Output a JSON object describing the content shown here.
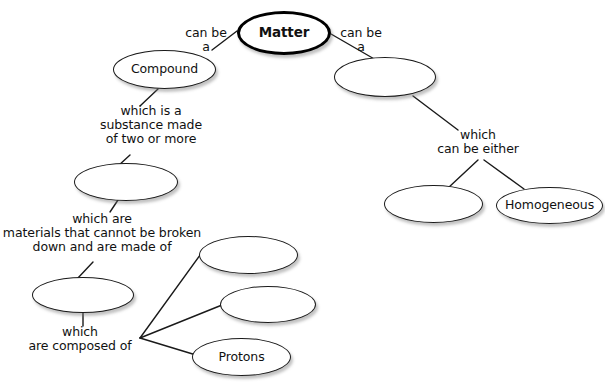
{
  "diagram": {
    "type": "concept-map",
    "style": {
      "background": "#ffffff",
      "node_stroke": "#1a1a1a",
      "root_stroke": "#000000",
      "edge_stroke": "#1a1a1a",
      "text_color": "#111111"
    },
    "nodes": [
      {
        "id": "matter",
        "label": "Matter",
        "filled": true,
        "root": true,
        "x": 237,
        "y": 11,
        "w": 94,
        "h": 44
      },
      {
        "id": "compound",
        "label": "Compound",
        "filled": true,
        "root": false,
        "x": 113,
        "y": 50,
        "w": 103,
        "h": 39
      },
      {
        "id": "blank-left-1",
        "label": "",
        "filled": false,
        "root": false,
        "x": 74,
        "y": 163,
        "w": 104,
        "h": 38
      },
      {
        "id": "blank-left-2",
        "label": "",
        "filled": false,
        "root": false,
        "x": 32,
        "y": 277,
        "w": 102,
        "h": 36
      },
      {
        "id": "blank-sub-1",
        "label": "",
        "filled": false,
        "root": false,
        "x": 199,
        "y": 236,
        "w": 99,
        "h": 38
      },
      {
        "id": "blank-sub-2",
        "label": "",
        "filled": false,
        "root": false,
        "x": 220,
        "y": 286,
        "w": 96,
        "h": 37
      },
      {
        "id": "protons",
        "label": "Protons",
        "filled": true,
        "root": false,
        "x": 192,
        "y": 338,
        "w": 99,
        "h": 38
      },
      {
        "id": "blank-right-1",
        "label": "",
        "filled": false,
        "root": false,
        "x": 334,
        "y": 57,
        "w": 102,
        "h": 40
      },
      {
        "id": "blank-right-2",
        "label": "",
        "filled": false,
        "root": false,
        "x": 384,
        "y": 185,
        "w": 99,
        "h": 38
      },
      {
        "id": "homogeneous",
        "label": "Homogeneous",
        "filled": true,
        "root": false,
        "x": 496,
        "y": 187,
        "w": 107,
        "h": 37
      }
    ],
    "edge_labels": [
      {
        "id": "lbl-can-be-a-left",
        "text": "can be\na",
        "x": 176,
        "y": 26,
        "w": 60
      },
      {
        "id": "lbl-can-be-a-right",
        "text": "can be\na",
        "x": 331,
        "y": 26,
        "w": 60
      },
      {
        "id": "lbl-which-is-a",
        "text": "which is a\nsubstance made\nof two or more",
        "x": 88,
        "y": 104,
        "w": 126
      },
      {
        "id": "lbl-which-are",
        "text": "which are\nmaterials that cannot be broken\ndown and are made of",
        "x": 2,
        "y": 212,
        "w": 200
      },
      {
        "id": "lbl-which-composed",
        "text": "which\nare composed of",
        "x": 22,
        "y": 325,
        "w": 116
      },
      {
        "id": "lbl-which-either",
        "text": "which\ncan be either",
        "x": 428,
        "y": 128,
        "w": 100
      }
    ],
    "edges": [
      {
        "id": "edge-matter-compound",
        "from": "matter",
        "to": "compound",
        "points": [
          [
            237,
            31
          ],
          [
            212,
            50
          ]
        ]
      },
      {
        "id": "edge-matter-right",
        "from": "matter",
        "to": "blank-right-1",
        "points": [
          [
            331,
            34
          ],
          [
            376,
            60
          ]
        ]
      },
      {
        "id": "edge-compound-blank1",
        "from": "compound",
        "to": "blank-left-1",
        "points": [
          [
            158,
            89
          ],
          [
            140,
            106
          ]
        ]
      },
      {
        "id": "edge-blank1-label",
        "from": "blank-left-1",
        "to": "blank-left-2",
        "points": [
          [
            130,
            155
          ],
          [
            118,
            166
          ]
        ]
      },
      {
        "id": "edge-blank1-down",
        "from": "blank-left-1",
        "to": "lbl-which-are",
        "points": [
          [
            118,
            200
          ],
          [
            110,
            212
          ]
        ]
      },
      {
        "id": "edge-label-blank2",
        "from": "lbl-which-are",
        "to": "blank-left-2",
        "points": [
          [
            93,
            262
          ],
          [
            77,
            279
          ]
        ]
      },
      {
        "id": "edge-blank2-down",
        "from": "blank-left-2",
        "to": "lbl-which-comp",
        "points": [
          [
            83,
            312
          ],
          [
            83,
            326
          ]
        ]
      },
      {
        "id": "edge-fan-sub1",
        "from": "lbl-which-comp",
        "to": "blank-sub-1",
        "points": [
          [
            140,
            338
          ],
          [
            203,
            251
          ]
        ]
      },
      {
        "id": "edge-fan-sub2",
        "from": "lbl-which-comp",
        "to": "blank-sub-2",
        "points": [
          [
            140,
            338
          ],
          [
            222,
            305
          ]
        ]
      },
      {
        "id": "edge-fan-protons",
        "from": "lbl-which-comp",
        "to": "protons",
        "points": [
          [
            140,
            338
          ],
          [
            196,
            355
          ]
        ]
      },
      {
        "id": "edge-right1-label",
        "from": "blank-right-1",
        "to": "lbl-which-either",
        "points": [
          [
            413,
            96
          ],
          [
            458,
            130
          ]
        ]
      },
      {
        "id": "edge-either-blank",
        "from": "lbl-which-either",
        "to": "blank-right-2",
        "points": [
          [
            478,
            160
          ],
          [
            448,
            188
          ]
        ]
      },
      {
        "id": "edge-either-homog",
        "from": "lbl-which-either",
        "to": "homogeneous",
        "points": [
          [
            484,
            160
          ],
          [
            524,
            189
          ]
        ]
      }
    ]
  }
}
